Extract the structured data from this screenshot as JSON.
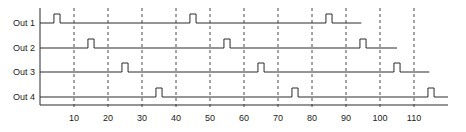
{
  "chart_data": {
    "type": "timing-diagram",
    "title": "",
    "xlabel": "",
    "ylabel": "",
    "x_ticks": [
      10,
      20,
      30,
      40,
      50,
      60,
      70,
      80,
      90,
      100,
      110
    ],
    "xlim": [
      0,
      120
    ],
    "grid": "vertical dashed at each tick",
    "pulse_width": 1.8,
    "signals": [
      {
        "name": "Out 1",
        "pulses": [
          5,
          45,
          85
        ],
        "end": 94.5
      },
      {
        "name": "Out 2",
        "pulses": [
          15,
          55,
          95
        ],
        "end": 105
      },
      {
        "name": "Out 3",
        "pulses": [
          25,
          65,
          105
        ],
        "end": 114.5
      },
      {
        "name": "Out 4",
        "pulses": [
          35,
          75,
          115
        ],
        "end": 120
      }
    ]
  },
  "colors": {
    "line": "#2a2a2a",
    "grid": "#333333",
    "background": "#ffffff"
  }
}
